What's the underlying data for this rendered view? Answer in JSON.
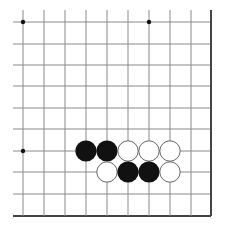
{
  "board": {
    "description": "Go board corner diagram (bottom-right region visible)",
    "columns_x": [
      23,
      44,
      65,
      86,
      107,
      128,
      149,
      170,
      191,
      211
    ],
    "rows_y": [
      22,
      44,
      65,
      86,
      108,
      129,
      151,
      172,
      194,
      216
    ],
    "left_overhang_x": 13,
    "top_overhang_y": 10,
    "edge_right": true,
    "edge_bottom": true,
    "colors": {
      "background": "#ffffff",
      "grid_line": "#8a8a8a",
      "edge_line": "#444444",
      "black_stone": "#111111",
      "white_stone_fill": "#ffffff",
      "white_stone_stroke": "#666666",
      "star_point": "#111111"
    },
    "star_points": [
      {
        "col": 0,
        "row": 0
      },
      {
        "col": 6,
        "row": 0
      },
      {
        "col": 0,
        "row": 6
      }
    ],
    "stones": [
      {
        "color": "black",
        "col": 3,
        "row": 6
      },
      {
        "color": "black",
        "col": 4,
        "row": 6
      },
      {
        "color": "white",
        "col": 5,
        "row": 6
      },
      {
        "color": "white",
        "col": 6,
        "row": 6
      },
      {
        "color": "white",
        "col": 7,
        "row": 6
      },
      {
        "color": "white",
        "col": 4,
        "row": 7
      },
      {
        "color": "black",
        "col": 5,
        "row": 7
      },
      {
        "color": "black",
        "col": 6,
        "row": 7
      },
      {
        "color": "white",
        "col": 7,
        "row": 7
      }
    ]
  }
}
